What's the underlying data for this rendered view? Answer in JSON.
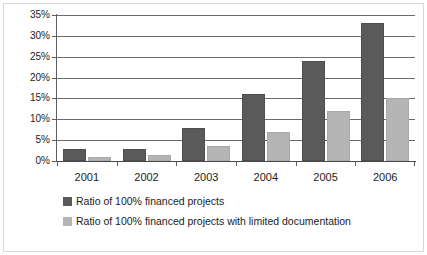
{
  "chart_data": {
    "type": "bar",
    "title": "",
    "xlabel": "",
    "ylabel": "",
    "categories": [
      "2001",
      "2002",
      "2003",
      "2004",
      "2005",
      "2006"
    ],
    "series": [
      {
        "name": "Ratio of 100% financed projects",
        "color": "#5a5a5a",
        "values": [
          3,
          3,
          8,
          16,
          24,
          33
        ]
      },
      {
        "name": "Ratio of 100% financed projects with limited documentation",
        "color": "#b4b4b4",
        "values": [
          1,
          1.5,
          3.5,
          7,
          12,
          15
        ]
      }
    ],
    "ylim": [
      0,
      35
    ],
    "ytick_values": [
      0,
      5,
      10,
      15,
      20,
      25,
      30,
      35
    ],
    "ytick_labels": [
      "0%",
      "5%",
      "10%",
      "15%",
      "20%",
      "25%",
      "30%",
      "35%"
    ],
    "grid": true,
    "legend_position": "bottom-left",
    "value_suffix": "%"
  },
  "legend": {
    "items": [
      {
        "label": "Ratio of 100% financed projects",
        "swatch": "dark-swatch"
      },
      {
        "label": "Ratio of 100% financed projects with limited documentation",
        "swatch": "light-swatch"
      }
    ]
  }
}
